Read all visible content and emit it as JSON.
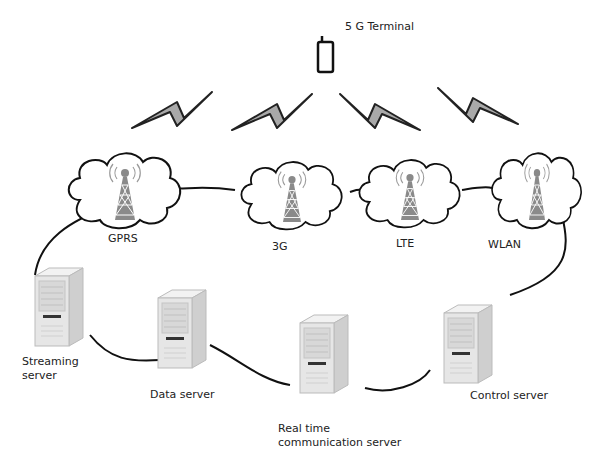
{
  "terminal": {
    "label": "5 G Terminal"
  },
  "networks": [
    {
      "id": "gprs",
      "label": "GPRS"
    },
    {
      "id": "3g",
      "label": "3G"
    },
    {
      "id": "lte",
      "label": "LTE"
    },
    {
      "id": "wlan",
      "label": "WLAN"
    }
  ],
  "servers": [
    {
      "id": "streaming",
      "label": "Streaming server"
    },
    {
      "id": "data",
      "label": "Data server"
    },
    {
      "id": "rtc",
      "label": "Real time communication server"
    },
    {
      "id": "control",
      "label": "Control server"
    }
  ],
  "colors": {
    "bolt": "#a9a9a9",
    "tower": "#8a8a8a",
    "server": "#e6e6e6",
    "line": "#111111"
  }
}
